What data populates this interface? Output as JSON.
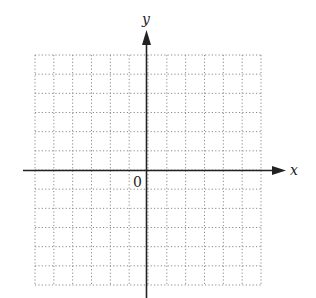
{
  "diagram": {
    "type": "coordinate-grid",
    "axes": {
      "x_label": "x",
      "y_label": "y",
      "origin_label": "0"
    },
    "grid": {
      "columns": 12,
      "rows": 12,
      "line_style": "dotted",
      "left": 35,
      "top": 55,
      "right": 261,
      "bottom": 285
    },
    "colors": {
      "grid": "#8a8a8a",
      "axis": "#222222",
      "background": "#ffffff"
    }
  }
}
